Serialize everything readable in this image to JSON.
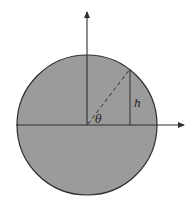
{
  "diagram": {
    "type": "geometry-circle-height",
    "labels": {
      "angle": "θ",
      "height": "h"
    },
    "colors": {
      "circle_fill": "#9b9b9b",
      "stroke": "#2e2e2e",
      "background": "#ffffff"
    },
    "circle": {
      "cx": 87,
      "cy": 125,
      "r": 70
    },
    "axes": {
      "horizontal": {
        "x1": 16,
        "y": 125,
        "x2": 186
      },
      "vertical": {
        "x": 87,
        "y1": 125,
        "y2": 10
      }
    },
    "radius_point": {
      "x": 130,
      "y": 69
    }
  }
}
